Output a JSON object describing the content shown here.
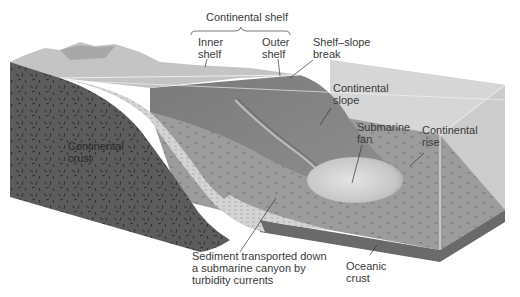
{
  "figure": {
    "type": "block-diagram"
  },
  "labels": {
    "continental_shelf": "Continental shelf",
    "inner_shelf": "Inner\nshelf",
    "outer_shelf": "Outer\nshelf",
    "shelf_slope_break": "Shelf–slope\nbreak",
    "continental_slope": "Continental\nslope",
    "submarine_fan": "Submarine\nfan",
    "continental_rise": "Continental\nrise",
    "continental_crust": "Continental\ncrust",
    "sediment_transport": "Sediment transported down\na submarine canyon by\nturbidity currents",
    "oceanic_crust": "Oceanic\ncrust"
  },
  "colors": {
    "crust_dark": "#5a5a5a",
    "crust_fleck": "#2a2a2a",
    "shelf_light": "#c8c8c8",
    "slope_mid": "#8a8a8a",
    "seafloor": "#9a9a9a",
    "water_box": "#cfcfcf",
    "ocean_crust_side": "#6e6e6e",
    "fan": "#d8d8d8",
    "sediment_layers": "#d0d0d0",
    "text": "#3a3a3a"
  }
}
